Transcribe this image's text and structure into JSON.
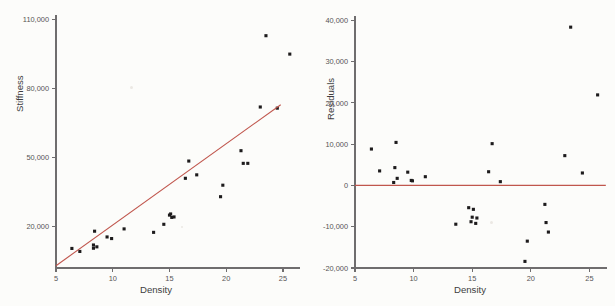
{
  "figure": {
    "background_color": "#fcfcfa",
    "point_color": "#1d1b1c",
    "line_color": "#c0564d",
    "axis_color": "#6f6d6e",
    "text_color": "#4a4849"
  },
  "chart_data": [
    {
      "type": "scatter",
      "panel": "left",
      "title": "",
      "xlabel": "Density",
      "ylabel": "Stiffness",
      "xlim": [
        5,
        26.5
      ],
      "ylim": [
        2000,
        112000
      ],
      "xticks": [
        5,
        10,
        15,
        20,
        25
      ],
      "xticklabels": [
        "5",
        "10",
        "15",
        "20",
        "25"
      ],
      "yticks": [
        20000,
        50000,
        80000,
        110000
      ],
      "yticklabels": [
        "20,000",
        "50,000",
        "80,000",
        "110,000"
      ],
      "grid": false,
      "legend": "none",
      "series": [
        {
          "name": "Observations",
          "marker": "filled-square",
          "x": [
            6.4,
            7.1,
            8.3,
            8.3,
            8.4,
            8.6,
            9.5,
            9.9,
            11.0,
            13.6,
            14.5,
            15.0,
            15.1,
            15.2,
            15.4,
            16.4,
            16.7,
            17.4,
            19.5,
            19.7,
            21.3,
            21.5,
            21.9,
            23.0,
            23.5,
            24.5,
            25.6
          ],
          "y": [
            10500,
            9200,
            12000,
            10600,
            18000,
            11200,
            15500,
            14800,
            19000,
            17500,
            21000,
            25000,
            25500,
            24000,
            24200,
            41000,
            48500,
            42500,
            33000,
            38000,
            53000,
            47500,
            47500,
            72000,
            103000,
            71500,
            95000
          ]
        },
        {
          "name": "Least-squares fit",
          "marker": "line",
          "line_x": [
            5,
            24.8
          ],
          "line_y": [
            3000,
            73000
          ]
        }
      ]
    },
    {
      "type": "scatter",
      "panel": "right",
      "title": "",
      "xlabel": "Density",
      "ylabel": "Residuals",
      "xlim": [
        5,
        26.5
      ],
      "ylim": [
        -20000,
        41000
      ],
      "xticks": [
        5,
        10,
        15,
        20,
        25
      ],
      "xticklabels": [
        "5",
        "10",
        "15",
        "20",
        "25"
      ],
      "yticks": [
        -20000,
        -10000,
        0,
        10000,
        20000,
        30000,
        40000
      ],
      "yticklabels": [
        "-20,000",
        "-10,000",
        "0",
        "10,000",
        "20,000",
        "30,000",
        "40,000"
      ],
      "grid": false,
      "legend": "none",
      "series": [
        {
          "name": "Residuals",
          "marker": "filled-square",
          "x": [
            6.4,
            7.1,
            8.3,
            8.4,
            8.5,
            8.6,
            9.5,
            9.8,
            9.9,
            11.0,
            13.6,
            14.7,
            14.9,
            15.0,
            15.1,
            15.3,
            15.4,
            16.4,
            16.7,
            17.4,
            19.5,
            19.7,
            21.2,
            21.3,
            21.5,
            22.9,
            23.4,
            24.4,
            25.7
          ],
          "y": [
            8800,
            3500,
            700,
            4300,
            10400,
            1700,
            3200,
            1200,
            1100,
            2100,
            -9400,
            -5400,
            -8800,
            -7700,
            -5800,
            -9200,
            -7900,
            3300,
            10100,
            900,
            -18400,
            -13500,
            -4600,
            -9000,
            -11300,
            7200,
            38300,
            3000,
            21900
          ]
        },
        {
          "name": "Zero reference line",
          "marker": "line",
          "line_x": [
            5,
            26.4
          ],
          "line_y": [
            0,
            0
          ]
        }
      ]
    }
  ]
}
